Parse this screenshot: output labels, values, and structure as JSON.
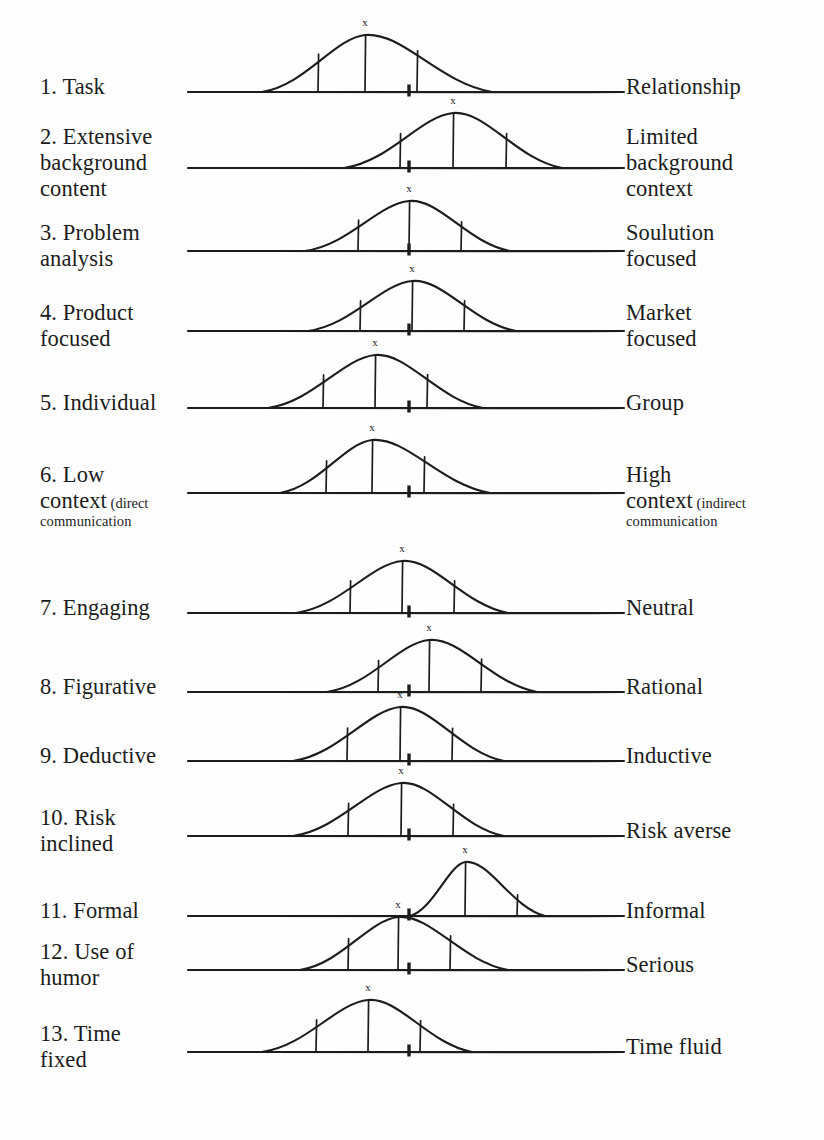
{
  "figure": {
    "type": "diagram",
    "peak_marker_label": "x",
    "scale_left_px": 186,
    "scale_right_px": 626,
    "midpoint_px": 409,
    "ink_color": "#1c1c1c",
    "page_background": "#fefefe"
  },
  "rows": [
    {
      "number": "1.",
      "left_label": "1. Task",
      "right_label": "Relationship",
      "left_lines": [
        "1. Task"
      ],
      "right_lines": [
        "Relationship"
      ],
      "baseline_y": 92,
      "curve": {
        "left": 262,
        "right": 492,
        "peak_x": 365,
        "height": 57
      },
      "ticks": [
        318,
        365,
        417
      ],
      "midpoint_x": 409,
      "peak_offset_from_midpoint": -44
    },
    {
      "number": "2.",
      "left_label": "2. Extensive background content",
      "right_label": "Limited background context",
      "left_lines": [
        "2. Extensive",
        "background",
        "content"
      ],
      "right_lines": [
        "Limited",
        "background",
        "context"
      ],
      "baseline_y": 168,
      "curve": {
        "left": 344,
        "right": 562,
        "peak_x": 453,
        "height": 55
      },
      "ticks": [
        400,
        453,
        506
      ],
      "midpoint_x": 409,
      "peak_offset_from_midpoint": 44
    },
    {
      "number": "3.",
      "left_label": "3. Problem analysis",
      "right_label": "Soulution focused",
      "left_lines": [
        "3. Problem",
        "analysis"
      ],
      "right_lines": [
        "Soulution",
        "focused"
      ],
      "baseline_y": 251,
      "curve": {
        "left": 305,
        "right": 510,
        "peak_x": 409,
        "height": 50
      },
      "ticks": [
        358,
        409,
        461
      ],
      "midpoint_x": 409,
      "peak_offset_from_midpoint": 0
    },
    {
      "number": "4.",
      "left_label": "4. Product focused",
      "right_label": "Market focused",
      "left_lines": [
        "4. Product",
        "focused"
      ],
      "right_lines": [
        "Market",
        "focused"
      ],
      "baseline_y": 331,
      "curve": {
        "left": 308,
        "right": 516,
        "peak_x": 412,
        "height": 50
      },
      "ticks": [
        360,
        412,
        464
      ],
      "midpoint_x": 409,
      "peak_offset_from_midpoint": 3
    },
    {
      "number": "5.",
      "left_label": "5. Individual",
      "right_label": "Group",
      "left_lines": [
        "5. Individual"
      ],
      "right_lines": [
        "Group"
      ],
      "baseline_y": 408,
      "curve": {
        "left": 268,
        "right": 483,
        "peak_x": 375,
        "height": 53
      },
      "ticks": [
        323,
        375,
        427
      ],
      "midpoint_x": 409,
      "peak_offset_from_midpoint": -34
    },
    {
      "number": "6.",
      "left_label": "6. Low context (direct communication",
      "right_label": "High context (indirect communication",
      "left_lines": [
        "6. Low",
        "context",
        "(direct",
        "communication"
      ],
      "right_lines": [
        "High",
        "context",
        "(indirect",
        "communication"
      ],
      "left_main": "context",
      "left_paren": "(direct",
      "left_paren2": "communication",
      "right_main": "context",
      "right_paren": "(indirect",
      "right_paren2": "communication",
      "baseline_y": 493,
      "curve": {
        "left": 280,
        "right": 490,
        "peak_x": 372,
        "height": 53
      },
      "ticks": [
        326,
        372,
        424
      ],
      "midpoint_x": 409,
      "peak_offset_from_midpoint": -37
    },
    {
      "number": "7.",
      "left_label": "7. Engaging",
      "right_label": "Neutral",
      "left_lines": [
        "7. Engaging"
      ],
      "right_lines": [
        "Neutral"
      ],
      "baseline_y": 613,
      "curve": {
        "left": 296,
        "right": 508,
        "peak_x": 402,
        "height": 52
      },
      "ticks": [
        350,
        402,
        454
      ],
      "midpoint_x": 409,
      "peak_offset_from_midpoint": -7
    },
    {
      "number": "8.",
      "left_label": "8. Figurative",
      "right_label": "Rational",
      "left_lines": [
        "8. Figurative"
      ],
      "right_lines": [
        "Rational"
      ],
      "baseline_y": 692,
      "curve": {
        "left": 327,
        "right": 537,
        "peak_x": 429,
        "height": 52
      },
      "ticks": [
        378,
        429,
        481
      ],
      "midpoint_x": 409,
      "peak_offset_from_midpoint": 20
    },
    {
      "number": "9.",
      "left_label": "9. Deductive",
      "right_label": "Inductive",
      "left_lines": [
        "9. Deductive"
      ],
      "right_lines": [
        "Inductive"
      ],
      "baseline_y": 761,
      "curve": {
        "left": 293,
        "right": 504,
        "peak_x": 400,
        "height": 54
      },
      "ticks": [
        347,
        400,
        452
      ],
      "midpoint_x": 409,
      "peak_offset_from_midpoint": -9
    },
    {
      "number": "10.",
      "left_label": "10. Risk inclined",
      "right_label": "Risk averse",
      "left_lines": [
        "10. Risk",
        "inclined"
      ],
      "right_lines": [
        "Risk averse"
      ],
      "baseline_y": 836,
      "curve": {
        "left": 293,
        "right": 504,
        "peak_x": 401,
        "height": 53
      },
      "ticks": [
        348,
        401,
        453
      ],
      "midpoint_x": 409,
      "peak_offset_from_midpoint": -8
    },
    {
      "number": "11.",
      "left_label": "11. Formal",
      "right_label": "Informal",
      "left_lines": [
        "11. Formal"
      ],
      "right_lines": [
        "Informal"
      ],
      "baseline_y": 916,
      "curve": {
        "left": 410,
        "right": 545,
        "peak_x": 465,
        "height": 54
      },
      "ticks": [
        412,
        465,
        517
      ],
      "midpoint_x": 409,
      "peak_offset_from_midpoint": 56
    },
    {
      "number": "12.",
      "left_label": "12. Use of humor",
      "right_label": "Serious",
      "left_lines": [
        "12. Use of",
        "humor"
      ],
      "right_lines": [
        "Serious"
      ],
      "baseline_y": 970,
      "curve": {
        "left": 300,
        "right": 508,
        "peak_x": 398,
        "height": 53
      },
      "ticks": [
        348,
        398,
        450
      ],
      "midpoint_x": 409,
      "peak_offset_from_midpoint": -11
    },
    {
      "number": "13.",
      "left_label": "13. Time fixed",
      "right_label": "Time fluid",
      "left_lines": [
        "13. Time",
        "fixed"
      ],
      "right_lines": [
        "Time fluid"
      ],
      "baseline_y": 1052,
      "curve": {
        "left": 262,
        "right": 472,
        "peak_x": 368,
        "height": 52
      },
      "ticks": [
        316,
        368,
        420
      ],
      "midpoint_x": 409,
      "peak_offset_from_midpoint": -41
    }
  ]
}
